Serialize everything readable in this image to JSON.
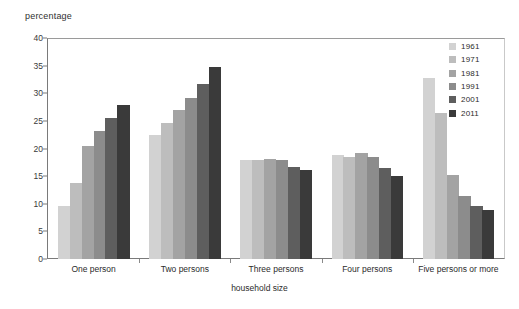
{
  "chart_data": {
    "type": "bar",
    "title": "",
    "xlabel": "household size",
    "ylabel": "percentage",
    "ylim": [
      0,
      40
    ],
    "yticks": [
      0,
      5,
      10,
      15,
      20,
      25,
      30,
      35,
      40
    ],
    "grid": false,
    "legend_position": "top-right",
    "categories": [
      "One person",
      "Two persons",
      "Three persons",
      "Four persons",
      "Five persons or more"
    ],
    "series": [
      {
        "name": "1961",
        "color": "#d2d2d2",
        "values": [
          9.6,
          22.4,
          18.0,
          18.8,
          32.7
        ]
      },
      {
        "name": "1971",
        "color": "#bdbdbd",
        "values": [
          13.8,
          24.7,
          17.9,
          18.4,
          26.5
        ]
      },
      {
        "name": "1981",
        "color": "#a3a3a3",
        "values": [
          20.4,
          27.0,
          18.1,
          19.2,
          15.2
        ]
      },
      {
        "name": "1991",
        "color": "#8c8c8c",
        "values": [
          23.2,
          29.2,
          17.9,
          18.4,
          11.4
        ]
      },
      {
        "name": "2001",
        "color": "#5e5e5e",
        "values": [
          25.6,
          31.7,
          16.6,
          16.5,
          9.6
        ]
      },
      {
        "name": "2011",
        "color": "#3a3a3a",
        "values": [
          27.8,
          34.7,
          16.1,
          15.0,
          8.8
        ]
      }
    ]
  },
  "axes": {
    "y_title": "percentage",
    "x_title": "household size"
  }
}
